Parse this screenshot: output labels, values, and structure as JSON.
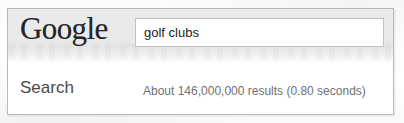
{
  "page": {
    "scan_background": "#fdfdfd",
    "frame_border_color": "#b9b9b9"
  },
  "header": {
    "brand": "Google",
    "brand_color": "#262626",
    "background_color": "#ebebeb",
    "search": {
      "value": "golf clubs",
      "placeholder": "Search",
      "background_color": "#ffffff",
      "border_color": "#c2c2c2",
      "text_color": "#1c1c1c"
    }
  },
  "results": {
    "section_label": "Search",
    "section_label_color": "#4a4a4a",
    "stats_text": "About 146,000,000 results (0.80 seconds)",
    "stats_color": "#707070",
    "result_count": "146,000,000",
    "elapsed_seconds": "0.80"
  }
}
